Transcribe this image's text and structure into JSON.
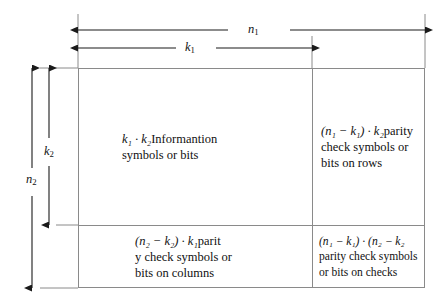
{
  "figure": {
    "name": "product-code-array-diagram",
    "background_color": "#ffffff",
    "line_color": "#8a8a8a",
    "text_color": "#111111"
  },
  "dimensions": {
    "horizontal": [
      {
        "id": "n1",
        "label_base": "n",
        "label_sub": "1",
        "description": "total number of columns",
        "span_start_px": 78,
        "span_end_px": 425
      },
      {
        "id": "k1",
        "label_base": "k",
        "label_sub": "1",
        "description": "information columns",
        "span_start_px": 78,
        "span_end_px": 312
      }
    ],
    "vertical": [
      {
        "id": "n2",
        "label_base": "n",
        "label_sub": "2",
        "description": "total number of rows",
        "span_start_px": 68,
        "span_end_px": 288
      },
      {
        "id": "k2",
        "label_base": "k",
        "label_sub": "2",
        "description": "information rows",
        "span_start_px": 68,
        "span_end_px": 225
      }
    ]
  },
  "cells": {
    "information": {
      "expr_lines": [
        "k",
        "1",
        "k",
        "2"
      ],
      "formula_html": "k₁ · k₂",
      "line1_text": "Informantion",
      "line2_text": "symbols or bits"
    },
    "row_parity": {
      "formula_html": "(n₁ − k₁) · k₂",
      "line1_text": "parity",
      "line2_text": "check symbols or",
      "line3_text": "bits on rows"
    },
    "column_parity": {
      "formula_html": "(n₂ − k₂) · k₁",
      "line1_text": "parit",
      "line2_text": "y check symbols or",
      "line3_text": "bits on columns"
    },
    "check_parity": {
      "formula_html": "(n₁ − k₁) · (n₂ − k₂",
      "line1_text": "",
      "line2_text": "parity check symbols",
      "line3_text": "or bits on checks"
    }
  }
}
